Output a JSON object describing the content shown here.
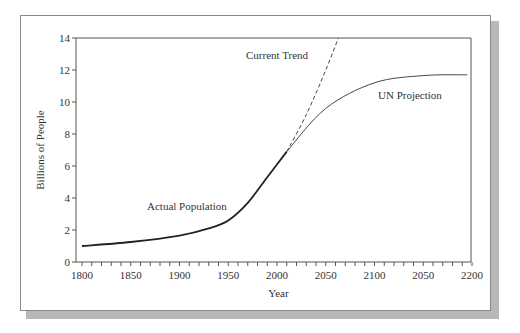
{
  "chart_data": {
    "type": "line",
    "title": "",
    "xlabel": "Year",
    "ylabel": "Billions of People",
    "xlim": [
      1800,
      2200
    ],
    "ylim": [
      0,
      14
    ],
    "x_tick_labels": [
      "1800",
      "1850",
      "1900",
      "1950",
      "2000",
      "2050",
      "2100",
      "2050",
      "2200"
    ],
    "y_tick_labels": [
      "0",
      "2",
      "4",
      "6",
      "8",
      "10",
      "12",
      "14"
    ],
    "grid": false,
    "series": [
      {
        "name": "Actual Population",
        "style": "solid-thick",
        "x": [
          1800,
          1850,
          1900,
          1930,
          1950,
          1970,
          1990,
          2010
        ],
        "y": [
          1.0,
          1.25,
          1.65,
          2.1,
          2.6,
          3.7,
          5.3,
          6.9
        ]
      },
      {
        "name": "Current Trend",
        "style": "dashed",
        "x": [
          2010,
          2030,
          2050,
          2063
        ],
        "y": [
          6.9,
          9.2,
          12.0,
          14.0
        ]
      },
      {
        "name": "UN Projection",
        "style": "solid-thin",
        "x": [
          2010,
          2050,
          2100,
          2150,
          2195
        ],
        "y": [
          6.9,
          9.6,
          11.2,
          11.65,
          11.7
        ]
      }
    ],
    "annotations": [
      {
        "text": "Actual Population",
        "x": 1900,
        "y": 3.0
      },
      {
        "text": "Current Trend",
        "x": 2000,
        "y": 13.0
      },
      {
        "text": "UN Projection",
        "x": 2125,
        "y": 10.5
      }
    ]
  },
  "labels": {
    "xlabel": "Year",
    "ylabel": "Billions of People",
    "actual": "Actual Population",
    "trend": "Current Trend",
    "un": "UN Projection"
  }
}
